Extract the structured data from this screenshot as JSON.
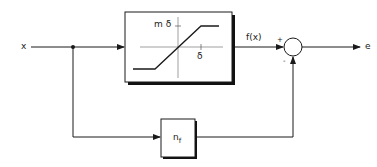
{
  "diagram": {
    "type": "block-diagram",
    "input": {
      "label": "x"
    },
    "output": {
      "label": "e"
    },
    "nonlinear_block": {
      "name": "saturation",
      "y_tick_label": "m δ",
      "x_tick_label": "δ",
      "output_label": "f(x)"
    },
    "feedforward_block": {
      "label_main": "n",
      "label_sub": "f"
    },
    "summing_junction": {
      "plus_sign": "+",
      "minus_sign": "-"
    },
    "colors": {
      "line": "#1a1a1a",
      "background": "#ffffff",
      "shadow": "#111111"
    }
  }
}
